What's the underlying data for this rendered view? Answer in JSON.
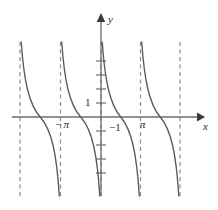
{
  "figure": {
    "title": "",
    "background_color": "#ffffff",
    "width": 218,
    "height": 210
  },
  "axes": {
    "y_axis_label": "y",
    "x_axis_label": "x",
    "axis_color": "#6d6d6d",
    "origin_px": {
      "x": 101,
      "y": 117
    }
  },
  "tick_labels": {
    "y_one": "1",
    "neg_one": "−1",
    "neg_pi": "−π",
    "pi": "π"
  },
  "chart_data": {
    "type": "line",
    "title": "",
    "xlabel": "x",
    "ylabel": "y",
    "function": "y = cot(x)",
    "grid": false,
    "legend": null,
    "xlim": [
      -2.5,
      2.5
    ],
    "ylim": [
      -4.2,
      4.2
    ],
    "x_tick_values": [
      -3.14159,
      3.14159
    ],
    "x_tick_labels": [
      "−π",
      "π"
    ],
    "y_tick_values": [
      1,
      -1
    ],
    "y_tick_labels": [
      "1",
      "−1"
    ],
    "period_px": 40,
    "asymptotes": {
      "color": "#8c8c8c",
      "style": "dashed",
      "x_values_pi": [
        -2,
        -1,
        0,
        1,
        2
      ],
      "x_px": [
        20,
        60.5,
        101,
        140.5,
        180
      ],
      "y_top_px": 42,
      "y_bottom_px": 196
    },
    "branches": [
      {
        "asymptote_left_px": 20,
        "asymptote_right_px": 60.5,
        "x_intercept_px": 40.2,
        "y_top_px": 42,
        "y_bottom_px": 196
      },
      {
        "asymptote_left_px": 60.5,
        "asymptote_right_px": 101,
        "x_intercept_px": 80.7,
        "y_top_px": 42,
        "y_bottom_px": 196
      },
      {
        "asymptote_left_px": 101,
        "asymptote_right_px": 140.5,
        "x_intercept_px": 120.7,
        "y_top_px": 42,
        "y_bottom_px": 196
      },
      {
        "asymptote_left_px": 140.5,
        "asymptote_right_px": 180,
        "x_intercept_px": 160.2,
        "y_top_px": 42,
        "y_bottom_px": 196
      }
    ],
    "curve_color": "#5a5a5a",
    "y_axis_ticks_px": [
      61,
      75,
      89,
      103,
      131,
      145,
      159,
      173
    ],
    "x_axis_ticks_px": []
  }
}
